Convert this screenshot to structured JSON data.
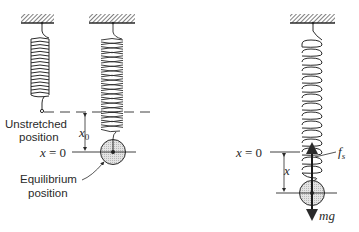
{
  "diagram": {
    "panels": [
      {
        "name": "unstretched",
        "labels": {
          "line1": "Unstretched",
          "line2": "position"
        }
      },
      {
        "name": "equilibrium",
        "labels": {
          "equilibrium_line1": "Equilibrium",
          "equilibrium_line2": "position",
          "x0_var": "x",
          "x0_sub": "0",
          "origin_var": "x",
          "origin_eq": " = 0"
        }
      },
      {
        "name": "displaced",
        "labels": {
          "origin_var": "x",
          "origin_eq": " = 0",
          "displacement": "x",
          "spring_force_var": "f",
          "spring_force_sub": "s",
          "weight": "mg"
        }
      }
    ],
    "colors": {
      "line": "#2a2a2a",
      "mass_fill": "#d8d8d8",
      "hatch": "#2a2a2a",
      "background": "#ffffff"
    }
  }
}
